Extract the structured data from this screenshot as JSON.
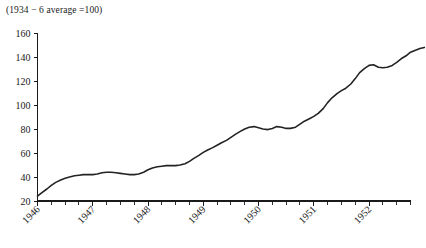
{
  "chart_data": {
    "type": "line",
    "title": "(1934 − 6 average =100)",
    "xlabel": "",
    "ylabel": "",
    "ylim": [
      20,
      160
    ],
    "xlim": [
      1946.0,
      1952.75
    ],
    "grid": false,
    "legend": null,
    "y_ticks": [
      20,
      40,
      60,
      80,
      100,
      120,
      140,
      160
    ],
    "y_tick_labels": [
      "20",
      "40",
      "60",
      "80",
      "100",
      "120",
      "140",
      "160"
    ],
    "x_ticks": [
      1946,
      1947,
      1948,
      1949,
      1950,
      1951,
      1952
    ],
    "x_tick_labels": [
      "1946",
      "1947",
      "1948",
      "1949",
      "1950",
      "1951",
      "1952"
    ],
    "x_minor_step": 0.25,
    "series": [
      {
        "name": "index",
        "x": [
          1946.0,
          1946.08,
          1946.17,
          1946.25,
          1946.33,
          1946.42,
          1946.5,
          1946.58,
          1946.67,
          1946.75,
          1946.83,
          1946.92,
          1947.0,
          1947.08,
          1947.17,
          1947.25,
          1947.33,
          1947.42,
          1947.5,
          1947.58,
          1947.67,
          1947.75,
          1947.83,
          1947.92,
          1948.0,
          1948.08,
          1948.17,
          1948.25,
          1948.33,
          1948.42,
          1948.5,
          1948.58,
          1948.67,
          1948.75,
          1948.83,
          1948.92,
          1949.0,
          1949.08,
          1949.17,
          1949.25,
          1949.33,
          1949.42,
          1949.5,
          1949.58,
          1949.67,
          1949.75,
          1949.83,
          1949.92,
          1950.0,
          1950.08,
          1950.17,
          1950.25,
          1950.33,
          1950.42,
          1950.5,
          1950.58,
          1950.67,
          1950.75,
          1950.83,
          1950.92,
          1951.0,
          1951.08,
          1951.17,
          1951.25,
          1951.33,
          1951.42,
          1951.5,
          1951.58,
          1951.67,
          1951.75,
          1951.83,
          1951.92,
          1952.0,
          1952.08,
          1952.17,
          1952.25,
          1952.33,
          1952.42,
          1952.5,
          1952.58,
          1952.67
        ],
        "values": [
          24,
          27,
          30,
          33,
          35.5,
          37.5,
          39,
          40,
          41,
          41.5,
          42,
          42,
          42,
          42.5,
          43.5,
          44,
          44,
          43.5,
          43,
          42.5,
          42,
          42,
          42.5,
          44,
          46,
          47.5,
          48.5,
          49,
          49.5,
          49.5,
          49.5,
          50,
          51,
          53,
          55.5,
          58,
          60.5,
          62.5,
          64.5,
          66.5,
          68.5,
          70.5,
          73,
          75.5,
          78,
          80,
          81.5,
          82,
          81,
          80,
          79.5,
          80.5,
          82,
          81.5,
          80.5,
          80.5,
          81.5,
          84,
          86.5,
          88.5,
          90.5,
          93,
          97,
          102,
          106,
          109.5,
          112,
          114,
          117.5,
          122,
          127,
          130.5,
          133,
          133.5,
          131.5,
          131,
          131.5,
          133,
          135.5,
          138.5,
          141
        ],
        "notes": "Index rises from about 24 in early 1946 to about 148 by late 1952"
      }
    ],
    "extended_tail": {
      "x": [
        1952.67,
        1952.75,
        1952.92,
        1953.0
      ],
      "values": [
        141,
        144,
        147,
        148
      ]
    }
  },
  "axes": {
    "y_axis_name": "y-axis",
    "x_axis_name": "x-axis"
  }
}
